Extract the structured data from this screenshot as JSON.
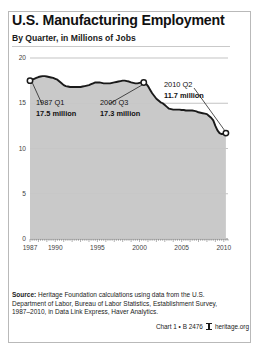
{
  "title": "U.S. Manufacturing Employment",
  "subtitle": "By Quarter, in Millions of Jobs",
  "annotations": {
    "start": {
      "period": "1987 Q1",
      "value": "17.5 million"
    },
    "peak": {
      "period": "2000 Q3",
      "value": "17.3 million"
    },
    "end": {
      "period": "2010 Q2",
      "value": "11.7 million"
    }
  },
  "source": {
    "label": "Source:",
    "text": " Heritage Foundation calculations using data from the U.S. Department of Labor, Bureau of Labor Statistics, Establishment Survey, 1987–2010, in Data Link Express, Haver Analytics."
  },
  "credit": {
    "chart_number": "Chart 1 • B 2476",
    "site": "heritage.org",
    "logo": "heritage-shield-icon"
  },
  "colors": {
    "area_fill": "#c6c6c6",
    "line": "#1a1a1a",
    "grid": "#9a9a9a",
    "frame": "#b9b9b9",
    "text": "#111111"
  },
  "chart_data": {
    "type": "area",
    "title": "U.S. Manufacturing Employment",
    "subtitle": "By Quarter, in Millions of Jobs",
    "xlabel": "",
    "ylabel": "Millions of Jobs",
    "xlim": [
      1987.0,
      2010.5
    ],
    "ylim": [
      0,
      20
    ],
    "yticks": [
      0,
      5,
      10,
      15,
      20
    ],
    "ytick_labels": [
      "0",
      "5",
      "10",
      "15",
      "20"
    ],
    "xticks": [
      1987,
      1990,
      1995,
      2000,
      2005,
      2010
    ],
    "xtick_labels": [
      "1987",
      "1990",
      "1995",
      "2000",
      "2005",
      "2010"
    ],
    "grid": true,
    "legend": "none",
    "markers": [
      {
        "x": 1987.0,
        "y": 17.5,
        "label": "1987 Q1 / 17.5 million"
      },
      {
        "x": 2000.5,
        "y": 17.3,
        "label": "2000 Q3 / 17.3 million"
      },
      {
        "x": 2010.25,
        "y": 11.7,
        "label": "2010 Q2 / 11.7 million"
      }
    ],
    "series": [
      {
        "name": "Manufacturing employment",
        "x": [
          1987.0,
          1987.25,
          1987.5,
          1987.75,
          1988.0,
          1988.25,
          1988.5,
          1988.75,
          1989.0,
          1989.25,
          1989.5,
          1989.75,
          1990.0,
          1990.25,
          1990.5,
          1990.75,
          1991.0,
          1991.25,
          1991.5,
          1991.75,
          1992.0,
          1992.25,
          1992.5,
          1992.75,
          1993.0,
          1993.25,
          1993.5,
          1993.75,
          1994.0,
          1994.25,
          1994.5,
          1994.75,
          1995.0,
          1995.25,
          1995.5,
          1995.75,
          1996.0,
          1996.25,
          1996.5,
          1996.75,
          1997.0,
          1997.25,
          1997.5,
          1997.75,
          1998.0,
          1998.25,
          1998.5,
          1998.75,
          1999.0,
          1999.25,
          1999.5,
          1999.75,
          2000.0,
          2000.25,
          2000.5,
          2000.75,
          2001.0,
          2001.25,
          2001.5,
          2001.75,
          2002.0,
          2002.25,
          2002.5,
          2002.75,
          2003.0,
          2003.25,
          2003.5,
          2003.75,
          2004.0,
          2004.25,
          2004.5,
          2004.75,
          2005.0,
          2005.25,
          2005.5,
          2005.75,
          2006.0,
          2006.25,
          2006.5,
          2006.75,
          2007.0,
          2007.25,
          2007.5,
          2007.75,
          2008.0,
          2008.25,
          2008.5,
          2008.75,
          2009.0,
          2009.25,
          2009.5,
          2009.75,
          2010.0,
          2010.25
        ],
        "y": [
          17.5,
          17.6,
          17.7,
          17.8,
          17.9,
          17.95,
          18.0,
          18.0,
          17.95,
          17.9,
          17.85,
          17.8,
          17.7,
          17.6,
          17.4,
          17.2,
          17.0,
          16.9,
          16.85,
          16.8,
          16.8,
          16.8,
          16.8,
          16.8,
          16.8,
          16.85,
          16.9,
          16.95,
          17.0,
          17.1,
          17.2,
          17.3,
          17.3,
          17.3,
          17.25,
          17.2,
          17.2,
          17.2,
          17.2,
          17.25,
          17.3,
          17.35,
          17.4,
          17.45,
          17.5,
          17.5,
          17.45,
          17.4,
          17.3,
          17.25,
          17.2,
          17.2,
          17.25,
          17.3,
          17.3,
          17.2,
          16.9,
          16.5,
          16.1,
          15.8,
          15.5,
          15.3,
          15.1,
          15.0,
          14.8,
          14.6,
          14.4,
          14.35,
          14.3,
          14.3,
          14.3,
          14.3,
          14.25,
          14.25,
          14.2,
          14.2,
          14.2,
          14.2,
          14.15,
          14.1,
          14.0,
          13.95,
          13.9,
          13.85,
          13.8,
          13.6,
          13.4,
          13.1,
          12.5,
          12.0,
          11.7,
          11.6,
          11.6,
          11.7
        ]
      }
    ]
  }
}
